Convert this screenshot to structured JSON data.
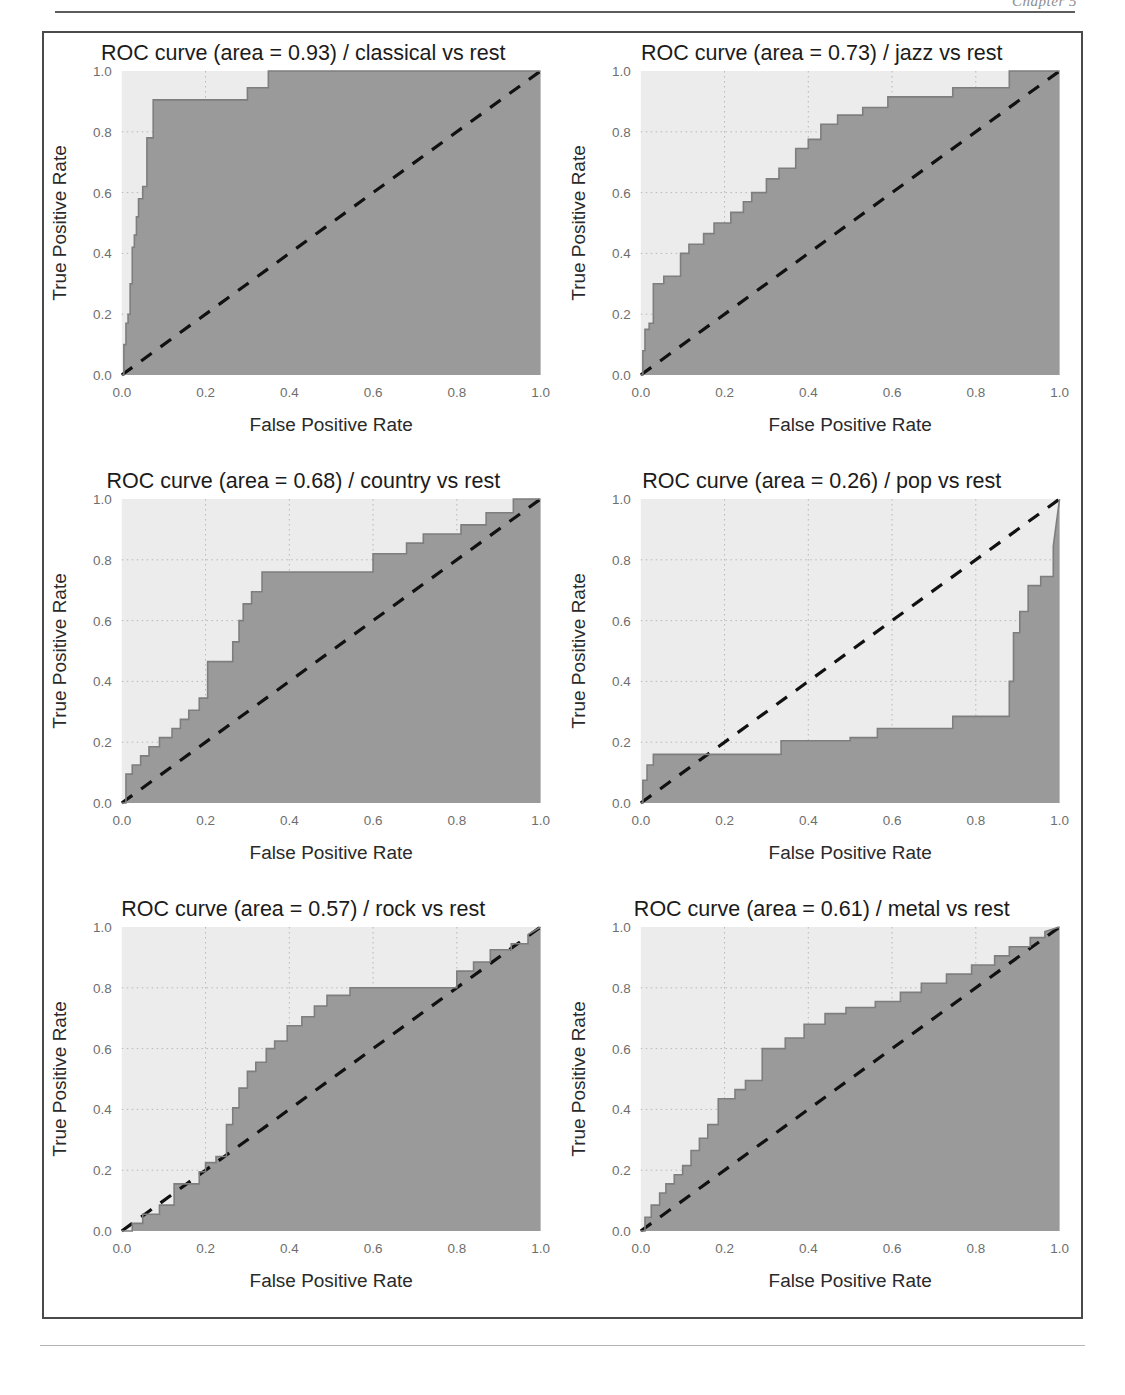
{
  "page": {
    "header_text": "Chapter 5",
    "background_color": "#ffffff"
  },
  "figure": {
    "rows": 3,
    "columns": 2,
    "frame_color": "#4a4a4a"
  },
  "style": {
    "plot_background": "#ececec",
    "fill_color": "#9a9a9a",
    "curve_color": "#7e7e7e",
    "diagonal_color": "#111111",
    "grid_color": "#b8b8b8",
    "tick_label_color": "#6e6e6e",
    "axis_label_color": "#2a2a2a"
  },
  "chart_data": [
    {
      "id": "classical",
      "type": "line",
      "title": "ROC curve (area = 0.93) / classical vs rest",
      "title_prefix": "ROC curve (area = ",
      "title_suffix": ") / classical vs rest",
      "area": 0.93,
      "class_label": "classical",
      "comparison": "vs rest",
      "xlabel": "False Positive Rate",
      "ylabel": "True Positive Rate",
      "xlim": [
        0.0,
        1.0
      ],
      "ylim": [
        0.0,
        1.0
      ],
      "xticks": [
        0.0,
        0.2,
        0.4,
        0.6,
        0.8,
        1.0
      ],
      "yticks": [
        0.0,
        0.2,
        0.4,
        0.6,
        0.8,
        1.0
      ],
      "xticklabels": [
        "0.0",
        "0.2",
        "0.4",
        "0.6",
        "0.8",
        "1.0"
      ],
      "yticklabels": [
        "0.0",
        "0.2",
        "0.4",
        "0.6",
        "0.8",
        "1.0"
      ],
      "grid": true,
      "legend": "none",
      "diagonal_reference": true,
      "fill_below_curve": true,
      "roc": {
        "fpr": [
          0.0,
          0.005,
          0.005,
          0.01,
          0.01,
          0.015,
          0.015,
          0.02,
          0.02,
          0.025,
          0.025,
          0.03,
          0.03,
          0.035,
          0.035,
          0.04,
          0.04,
          0.05,
          0.05,
          0.06,
          0.06,
          0.075,
          0.075,
          0.3,
          0.3,
          0.35,
          0.35,
          1.0
        ],
        "tpr": [
          0.0,
          0.0,
          0.1,
          0.1,
          0.17,
          0.17,
          0.2,
          0.2,
          0.3,
          0.3,
          0.42,
          0.42,
          0.46,
          0.46,
          0.52,
          0.52,
          0.58,
          0.58,
          0.62,
          0.62,
          0.78,
          0.78,
          0.905,
          0.905,
          0.945,
          0.945,
          1.0,
          1.0
        ]
      }
    },
    {
      "id": "jazz",
      "type": "line",
      "title": "ROC curve (area = 0.73) / jazz vs rest",
      "title_prefix": "ROC curve (area = ",
      "title_suffix": ") / jazz vs rest",
      "area": 0.73,
      "class_label": "jazz",
      "comparison": "vs rest",
      "xlabel": "False Positive Rate",
      "ylabel": "True Positive Rate",
      "xlim": [
        0.0,
        1.0
      ],
      "ylim": [
        0.0,
        1.0
      ],
      "xticks": [
        0.0,
        0.2,
        0.4,
        0.6,
        0.8,
        1.0
      ],
      "yticks": [
        0.0,
        0.2,
        0.4,
        0.6,
        0.8,
        1.0
      ],
      "xticklabels": [
        "0.0",
        "0.2",
        "0.4",
        "0.6",
        "0.8",
        "1.0"
      ],
      "yticklabels": [
        "0.0",
        "0.2",
        "0.4",
        "0.6",
        "0.8",
        "1.0"
      ],
      "grid": true,
      "legend": "none",
      "diagonal_reference": true,
      "fill_below_curve": true,
      "roc": {
        "fpr": [
          0.0,
          0.005,
          0.005,
          0.01,
          0.01,
          0.02,
          0.02,
          0.03,
          0.03,
          0.055,
          0.055,
          0.095,
          0.095,
          0.115,
          0.115,
          0.15,
          0.15,
          0.175,
          0.175,
          0.215,
          0.215,
          0.245,
          0.245,
          0.265,
          0.265,
          0.3,
          0.3,
          0.33,
          0.33,
          0.37,
          0.37,
          0.4,
          0.4,
          0.43,
          0.43,
          0.47,
          0.47,
          0.53,
          0.53,
          0.59,
          0.59,
          0.745,
          0.745,
          0.88,
          0.88,
          1.0
        ],
        "tpr": [
          0.0,
          0.0,
          0.08,
          0.08,
          0.15,
          0.15,
          0.17,
          0.17,
          0.3,
          0.3,
          0.325,
          0.325,
          0.4,
          0.4,
          0.43,
          0.43,
          0.465,
          0.465,
          0.5,
          0.5,
          0.535,
          0.535,
          0.57,
          0.57,
          0.6,
          0.6,
          0.645,
          0.645,
          0.68,
          0.68,
          0.745,
          0.745,
          0.775,
          0.775,
          0.825,
          0.825,
          0.855,
          0.855,
          0.88,
          0.88,
          0.915,
          0.915,
          0.945,
          0.945,
          1.0,
          1.0
        ]
      }
    },
    {
      "id": "country",
      "type": "line",
      "title": "ROC curve (area = 0.68) / country vs rest",
      "title_prefix": "ROC curve (area = ",
      "title_suffix": ") / country vs rest",
      "area": 0.68,
      "class_label": "country",
      "comparison": "vs rest",
      "xlabel": "False Positive Rate",
      "ylabel": "True Positive Rate",
      "xlim": [
        0.0,
        1.0
      ],
      "ylim": [
        0.0,
        1.0
      ],
      "xticks": [
        0.0,
        0.2,
        0.4,
        0.6,
        0.8,
        1.0
      ],
      "yticks": [
        0.0,
        0.2,
        0.4,
        0.6,
        0.8,
        1.0
      ],
      "xticklabels": [
        "0.0",
        "0.2",
        "0.4",
        "0.6",
        "0.8",
        "1.0"
      ],
      "yticklabels": [
        "0.0",
        "0.2",
        "0.4",
        "0.6",
        "0.8",
        "1.0"
      ],
      "grid": true,
      "legend": "none",
      "diagonal_reference": true,
      "fill_below_curve": true,
      "roc": {
        "fpr": [
          0.0,
          0.01,
          0.01,
          0.025,
          0.025,
          0.045,
          0.045,
          0.065,
          0.065,
          0.09,
          0.09,
          0.12,
          0.12,
          0.14,
          0.14,
          0.16,
          0.16,
          0.185,
          0.185,
          0.205,
          0.205,
          0.265,
          0.265,
          0.28,
          0.28,
          0.29,
          0.29,
          0.31,
          0.31,
          0.335,
          0.335,
          0.6,
          0.6,
          0.68,
          0.68,
          0.72,
          0.72,
          0.81,
          0.81,
          0.87,
          0.87,
          0.935,
          0.935,
          1.0
        ],
        "tpr": [
          0.0,
          0.0,
          0.095,
          0.095,
          0.125,
          0.125,
          0.155,
          0.155,
          0.185,
          0.185,
          0.215,
          0.215,
          0.245,
          0.245,
          0.275,
          0.275,
          0.305,
          0.305,
          0.345,
          0.345,
          0.465,
          0.465,
          0.53,
          0.53,
          0.6,
          0.6,
          0.655,
          0.655,
          0.695,
          0.695,
          0.76,
          0.76,
          0.82,
          0.82,
          0.855,
          0.855,
          0.885,
          0.885,
          0.915,
          0.915,
          0.955,
          0.955,
          1.0,
          1.0
        ]
      }
    },
    {
      "id": "pop",
      "type": "line",
      "title": "ROC curve (area = 0.26) / pop vs rest",
      "title_prefix": "ROC curve (area = ",
      "title_suffix": ") / pop vs rest",
      "area": 0.26,
      "class_label": "pop",
      "comparison": "vs rest",
      "xlabel": "False Positive Rate",
      "ylabel": "True Positive Rate",
      "xlim": [
        0.0,
        1.0
      ],
      "ylim": [
        0.0,
        1.0
      ],
      "xticks": [
        0.0,
        0.2,
        0.4,
        0.6,
        0.8,
        1.0
      ],
      "yticks": [
        0.0,
        0.2,
        0.4,
        0.6,
        0.8,
        1.0
      ],
      "xticklabels": [
        "0.0",
        "0.2",
        "0.4",
        "0.6",
        "0.8",
        "1.0"
      ],
      "yticklabels": [
        "0.0",
        "0.2",
        "0.4",
        "0.6",
        "0.8",
        "1.0"
      ],
      "grid": true,
      "legend": "none",
      "diagonal_reference": true,
      "fill_below_curve": true,
      "roc": {
        "fpr": [
          0.0,
          0.005,
          0.005,
          0.015,
          0.015,
          0.03,
          0.03,
          0.335,
          0.335,
          0.5,
          0.5,
          0.565,
          0.565,
          0.745,
          0.745,
          0.88,
          0.88,
          0.89,
          0.89,
          0.905,
          0.905,
          0.925,
          0.925,
          0.955,
          0.955,
          0.985,
          0.985,
          1.0
        ],
        "tpr": [
          0.0,
          0.0,
          0.075,
          0.075,
          0.125,
          0.125,
          0.16,
          0.16,
          0.205,
          0.205,
          0.215,
          0.215,
          0.245,
          0.245,
          0.285,
          0.285,
          0.4,
          0.4,
          0.56,
          0.56,
          0.63,
          0.63,
          0.715,
          0.715,
          0.745,
          0.745,
          0.845,
          1.0
        ]
      }
    },
    {
      "id": "rock",
      "type": "line",
      "title": "ROC curve (area = 0.57) / rock vs rest",
      "title_prefix": "ROC curve (area = ",
      "title_suffix": ") / rock vs rest",
      "area": 0.57,
      "class_label": "rock",
      "comparison": "vs rest",
      "xlabel": "False Positive Rate",
      "ylabel": "True Positive Rate",
      "xlim": [
        0.0,
        1.0
      ],
      "ylim": [
        0.0,
        1.0
      ],
      "xticks": [
        0.0,
        0.2,
        0.4,
        0.6,
        0.8,
        1.0
      ],
      "yticks": [
        0.0,
        0.2,
        0.4,
        0.6,
        0.8,
        1.0
      ],
      "xticklabels": [
        "0.0",
        "0.2",
        "0.4",
        "0.6",
        "0.8",
        "1.0"
      ],
      "yticklabels": [
        "0.0",
        "0.2",
        "0.4",
        "0.6",
        "0.8",
        "1.0"
      ],
      "grid": true,
      "legend": "none",
      "diagonal_reference": true,
      "fill_below_curve": true,
      "roc": {
        "fpr": [
          0.0,
          0.025,
          0.025,
          0.05,
          0.05,
          0.09,
          0.09,
          0.125,
          0.125,
          0.185,
          0.185,
          0.2,
          0.2,
          0.225,
          0.225,
          0.25,
          0.25,
          0.265,
          0.265,
          0.28,
          0.28,
          0.3,
          0.3,
          0.32,
          0.32,
          0.345,
          0.345,
          0.365,
          0.365,
          0.395,
          0.395,
          0.43,
          0.43,
          0.46,
          0.46,
          0.49,
          0.49,
          0.545,
          0.545,
          0.8,
          0.8,
          0.84,
          0.84,
          0.88,
          0.88,
          0.93,
          0.93,
          0.97,
          0.97,
          1.0
        ],
        "tpr": [
          0.0,
          0.0,
          0.025,
          0.025,
          0.055,
          0.055,
          0.085,
          0.085,
          0.155,
          0.155,
          0.195,
          0.195,
          0.225,
          0.225,
          0.245,
          0.245,
          0.35,
          0.35,
          0.405,
          0.405,
          0.47,
          0.47,
          0.525,
          0.525,
          0.555,
          0.555,
          0.6,
          0.6,
          0.625,
          0.625,
          0.675,
          0.675,
          0.705,
          0.705,
          0.74,
          0.74,
          0.775,
          0.775,
          0.8,
          0.8,
          0.855,
          0.855,
          0.885,
          0.885,
          0.925,
          0.925,
          0.945,
          0.945,
          0.975,
          1.0
        ]
      }
    },
    {
      "id": "metal",
      "type": "line",
      "title": "ROC curve (area = 0.61) / metal vs rest",
      "title_prefix": "ROC curve (area = ",
      "title_suffix": ") / metal vs rest",
      "area": 0.61,
      "class_label": "metal",
      "comparison": "vs rest",
      "xlabel": "False Positive Rate",
      "ylabel": "True Positive Rate",
      "xlim": [
        0.0,
        1.0
      ],
      "ylim": [
        0.0,
        1.0
      ],
      "xticks": [
        0.0,
        0.2,
        0.4,
        0.6,
        0.8,
        1.0
      ],
      "yticks": [
        0.0,
        0.2,
        0.4,
        0.6,
        0.8,
        1.0
      ],
      "xticklabels": [
        "0.0",
        "0.2",
        "0.4",
        "0.6",
        "0.8",
        "1.0"
      ],
      "yticklabels": [
        "0.0",
        "0.2",
        "0.4",
        "0.6",
        "0.8",
        "1.0"
      ],
      "grid": true,
      "legend": "none",
      "diagonal_reference": true,
      "fill_below_curve": true,
      "roc": {
        "fpr": [
          0.0,
          0.01,
          0.01,
          0.025,
          0.025,
          0.045,
          0.045,
          0.06,
          0.06,
          0.08,
          0.08,
          0.1,
          0.1,
          0.12,
          0.12,
          0.14,
          0.14,
          0.16,
          0.16,
          0.185,
          0.185,
          0.225,
          0.225,
          0.25,
          0.25,
          0.29,
          0.29,
          0.345,
          0.345,
          0.39,
          0.39,
          0.44,
          0.44,
          0.49,
          0.49,
          0.56,
          0.56,
          0.62,
          0.62,
          0.67,
          0.67,
          0.73,
          0.73,
          0.79,
          0.79,
          0.845,
          0.845,
          0.88,
          0.88,
          0.93,
          0.93,
          0.965,
          0.965,
          1.0
        ],
        "tpr": [
          0.0,
          0.0,
          0.045,
          0.045,
          0.085,
          0.085,
          0.125,
          0.125,
          0.155,
          0.155,
          0.185,
          0.185,
          0.215,
          0.215,
          0.265,
          0.265,
          0.305,
          0.305,
          0.35,
          0.35,
          0.435,
          0.435,
          0.465,
          0.465,
          0.495,
          0.495,
          0.6,
          0.6,
          0.635,
          0.635,
          0.68,
          0.68,
          0.715,
          0.715,
          0.735,
          0.735,
          0.755,
          0.755,
          0.785,
          0.785,
          0.815,
          0.815,
          0.845,
          0.845,
          0.875,
          0.875,
          0.905,
          0.905,
          0.935,
          0.935,
          0.965,
          0.965,
          0.985,
          1.0
        ]
      }
    }
  ]
}
